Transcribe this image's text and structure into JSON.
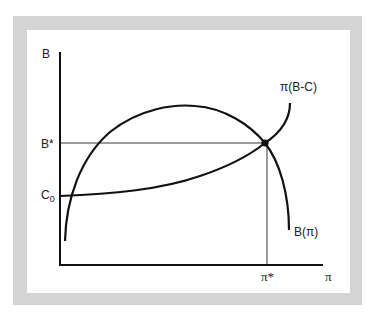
{
  "diagram": {
    "axes": {
      "y_label": "B",
      "x_label": "π"
    },
    "ticks": {
      "b_star": "B*",
      "c_zero": "C",
      "c_zero_sub": "0",
      "pi_star": "π*"
    },
    "curves": {
      "benefit": "B(π)",
      "cost": "π(B-C)"
    },
    "colors": {
      "frame": "#d4d4d4",
      "ink": "#111111"
    }
  }
}
